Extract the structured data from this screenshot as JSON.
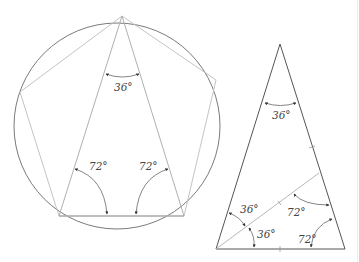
{
  "diagram": {
    "left_figure": {
      "description": "Circle with inscribed regular pentagon; isosceles triangle from top vertex to the two bottom vertices",
      "labels": {
        "apex_angle": "36°",
        "base_left_angle": "72°",
        "base_right_angle": "72°"
      }
    },
    "right_figure": {
      "description": "Golden triangle with angle bisector from bottom-left vertex to right side",
      "labels": {
        "apex_angle": "36°",
        "bisected_upper": "36°",
        "bisected_lower": "36°",
        "inner_angle": "72°",
        "base_right_angle": "72°"
      }
    },
    "colors": {
      "circle": "#7a7a7a",
      "thin_line": "#bdbdbd",
      "triangle_line": "#555555",
      "arc": "#666666",
      "text": "#444444"
    }
  }
}
